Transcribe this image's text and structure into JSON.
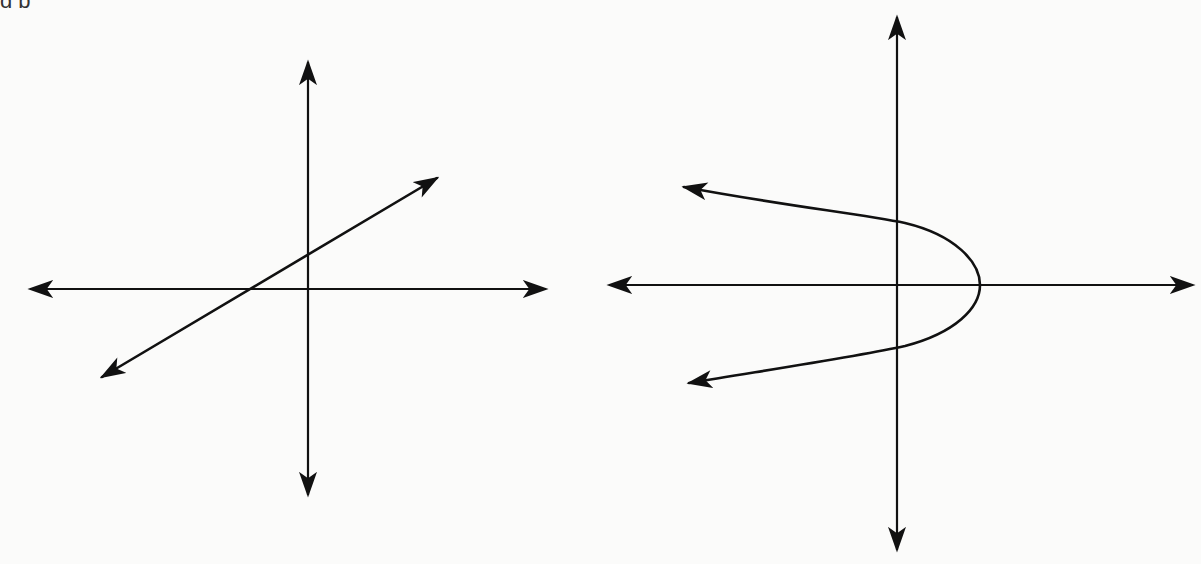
{
  "page": {
    "top_text_fragment": "g p"
  },
  "graphs": [
    {
      "id": "left",
      "description": "Coordinate axes with a straight line of positive slope crossing the negative x-axis and positive y-axis",
      "x_axis": {
        "y": 289,
        "x_start": 27,
        "x_end": 548,
        "arrows": "both"
      },
      "y_axis": {
        "x": 308,
        "y_start": 60,
        "y_end": 497,
        "arrows": "both"
      },
      "line": {
        "type": "linear",
        "start": [
          100,
          378
        ],
        "end": [
          439,
          177
        ],
        "arrows": "both",
        "x_intercept_px": [
          250,
          289
        ],
        "y_intercept_px": [
          308,
          256
        ]
      }
    },
    {
      "id": "right",
      "description": "Coordinate axes with a parabola opening to the left, vertex on the positive x-axis",
      "x_axis": {
        "y": 285,
        "x_start": 607,
        "x_end": 1195,
        "arrows": "both"
      },
      "y_axis": {
        "x": 897,
        "y_start": 15,
        "y_end": 552,
        "arrows": "both"
      },
      "curve": {
        "type": "parabola-left",
        "vertex": [
          980,
          285
        ],
        "upper_end": [
          682,
          186
        ],
        "lower_end": [
          687,
          384
        ],
        "y_intercepts_px": [
          [
            897,
            221
          ],
          [
            897,
            347
          ]
        ],
        "arrows": "both"
      }
    }
  ],
  "colors": {
    "background": "#fbfbfa",
    "stroke": "#111111"
  }
}
